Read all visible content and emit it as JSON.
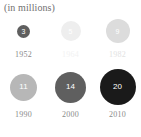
{
  "chart_title": "(in millions)",
  "chart_data": {
    "type": "bubble",
    "title": "(in millions)",
    "xlabel": "",
    "ylabel": "",
    "units": "millions",
    "grid": false,
    "legend": "none",
    "layout": "two-rows-of-three",
    "categories": [
      "1952",
      "1964",
      "1982",
      "1990",
      "2000",
      "2010"
    ],
    "values": [
      3,
      5,
      9,
      11,
      14,
      20
    ],
    "points": [
      {
        "year": "1952",
        "value": 3,
        "value_label": "3",
        "diameter_px": 13,
        "fill": "#5f5f5f",
        "label_color": "#8a8a8a",
        "value_color": "#ffffff"
      },
      {
        "year": "1964",
        "value": 5,
        "value_label": "5",
        "diameter_px": 20,
        "fill": "#eeeeee",
        "label_color": "#f2f2f2",
        "value_color": "#ffffff"
      },
      {
        "year": "1982",
        "value": 9,
        "value_label": "9",
        "diameter_px": 24,
        "fill": "#dcdcdc",
        "label_color": "#e2e2e2",
        "value_color": "#ffffff"
      },
      {
        "year": "1990",
        "value": 11,
        "value_label": "11",
        "diameter_px": 27,
        "fill": "#b7b7b7",
        "label_color": "#8a8a8a",
        "value_color": "#ffffff"
      },
      {
        "year": "2000",
        "value": 14,
        "value_label": "14",
        "diameter_px": 31,
        "fill": "#5f5f5f",
        "label_color": "#8a8a8a",
        "value_color": "#ffffff"
      },
      {
        "year": "2010",
        "value": 20,
        "value_label": "20",
        "diameter_px": 36,
        "fill": "#1a1a1a",
        "label_color": "#8a8a8a",
        "value_color": "#ffffff"
      }
    ]
  },
  "colors": {
    "background": "#ffffff",
    "title_text": "#6f6f6f",
    "dark_bubble": "#1a1a1a",
    "mid_bubble": "#5f5f5f",
    "light_bubble": "#dcdcdc"
  }
}
